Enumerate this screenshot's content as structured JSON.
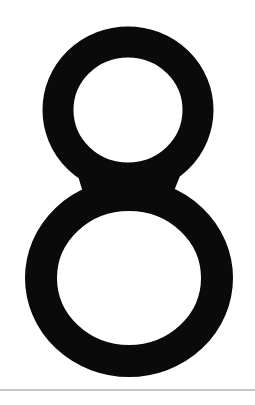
{
  "figure": {
    "character": "8",
    "glyph_color": "#0a0a0a",
    "background_color": "#ffffff",
    "rule_color": "#c8c8c8"
  }
}
